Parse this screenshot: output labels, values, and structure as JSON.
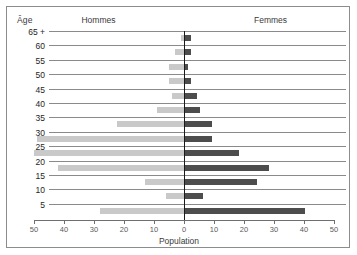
{
  "chart": {
    "age_axis_label": "Âge",
    "left_group_label": "Hommes",
    "right_group_label": "Femmes",
    "x_axis_label": "Population"
  },
  "chart_data": {
    "type": "bar",
    "subtype": "population-pyramid",
    "title": "",
    "xlabel": "Population",
    "ylabel": "Âge",
    "grid": true,
    "legend_position": "top",
    "xlim": [
      -50,
      50
    ],
    "x_ticks_left": [
      "50",
      "40",
      "30",
      "20",
      "10",
      "0"
    ],
    "x_ticks_right": [
      "0",
      "10",
      "20",
      "30",
      "40",
      "50"
    ],
    "x_tick_values": [
      -50,
      -40,
      -30,
      -20,
      -10,
      0,
      10,
      20,
      30,
      40,
      50
    ],
    "categories": [
      "65 +",
      "60",
      "55",
      "50",
      "45",
      "40",
      "35",
      "30",
      "25",
      "20",
      "15",
      "10",
      "5"
    ],
    "series": [
      {
        "name": "Hommes",
        "side": "left",
        "color": "#c9c9c9",
        "values": [
          1,
          3,
          5,
          5,
          4,
          9,
          22.5,
          49,
          50,
          42,
          13,
          6,
          28
        ]
      },
      {
        "name": "Femmes",
        "side": "right",
        "color": "#4d4d4d",
        "values": [
          2,
          2,
          1,
          2,
          4,
          5,
          9,
          9,
          18,
          28,
          24,
          6,
          10
        ]
      }
    ],
    "rows": [
      {
        "age": "65 +",
        "hommes": 1,
        "femmes": 2
      },
      {
        "age": "60",
        "hommes": 3,
        "femmes": 2
      },
      {
        "age": "55",
        "hommes": 5,
        "femmes": 1
      },
      {
        "age": "50",
        "hommes": 5,
        "femmes": 2
      },
      {
        "age": "45",
        "hommes": 4,
        "femmes": 4
      },
      {
        "age": "40",
        "hommes": 9,
        "femmes": 5
      },
      {
        "age": "35",
        "hommes": 22.5,
        "femmes": 9
      },
      {
        "age": "30",
        "hommes": 49,
        "femmes": 9
      },
      {
        "age": "25",
        "hommes": 50,
        "femmes": 18
      },
      {
        "age": "20",
        "hommes": 42,
        "femmes": 28
      },
      {
        "age": "15",
        "hommes": 13,
        "femmes": 24
      },
      {
        "age": "10",
        "hommes": 6,
        "femmes": 6
      },
      {
        "age": "5",
        "hommes": 28,
        "femmes": 40
      }
    ]
  },
  "colors": {
    "male_bar": "#c9c9c9",
    "female_bar": "#4d4d4d",
    "gridline": "#8a8a8a",
    "axis": "#1a1a1a",
    "frame": "#8c8c8c"
  }
}
